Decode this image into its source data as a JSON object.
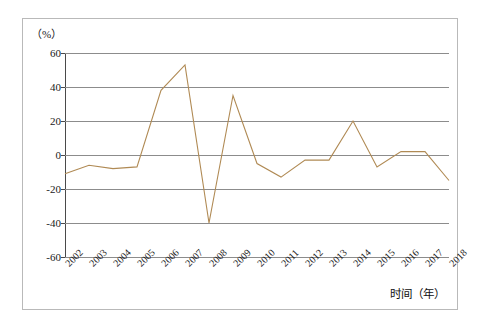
{
  "chart_data": {
    "type": "line",
    "title": "",
    "subtitle": "",
    "unit_label": "（%）",
    "xlabel": "时间（年）",
    "ylabel": "",
    "categories": [
      "2002",
      "2003",
      "2004",
      "2005",
      "2006",
      "2007",
      "2008",
      "2009",
      "2010",
      "2011",
      "2012",
      "2013",
      "2014",
      "2015",
      "2016",
      "2017",
      "2018"
    ],
    "values": [
      -11,
      -6,
      -8,
      -7,
      38,
      53,
      -40,
      35,
      -5,
      -13,
      -3,
      -3,
      20,
      -7,
      2,
      2,
      -15
    ],
    "series": [
      {
        "name": "",
        "color": "#b08a54",
        "values": [
          -11,
          -6,
          -8,
          -7,
          38,
          53,
          -40,
          35,
          -5,
          -13,
          -3,
          -3,
          20,
          -7,
          2,
          2,
          -15
        ]
      }
    ],
    "ylim": [
      -60,
      60
    ],
    "yticks": [
      60,
      40,
      20,
      0,
      -20,
      -40,
      -60
    ],
    "ytick_labels": [
      "60",
      "40",
      "20",
      "0",
      "-20",
      "-40",
      "-60"
    ],
    "grid": true,
    "grid_color": "#8c8c8c",
    "legend": null,
    "legend_position": "none",
    "xtick_rotation": -45,
    "line_color": "#b08a54",
    "axis_color": "#4a4a4a",
    "frame_color": "#b9b9b9",
    "background": "#ffffff"
  }
}
